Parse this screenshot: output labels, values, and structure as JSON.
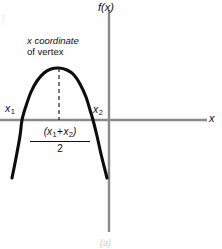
{
  "figure": {
    "panel_caption": "(a)",
    "background_color": "#fefefe"
  },
  "axes": {
    "y_label": "f(x)",
    "x_label": "x",
    "axis_color": "#8a8a8a",
    "x_axis_y": 120,
    "y_axis_x": 109
  },
  "annotations": {
    "vertex_note_line1": "x coordinate",
    "vertex_note_line2": "of vertex",
    "root_label_left": "x",
    "root_label_left_sub": "1",
    "root_label_right": "x",
    "root_label_right_sub": "2",
    "midpoint_numerator_open": "(x",
    "midpoint_numerator_sub1": "1",
    "midpoint_numerator_op": "+",
    "midpoint_numerator_var2": "x",
    "midpoint_numerator_sub2": "2",
    "midpoint_numerator_close": ")",
    "midpoint_denominator": "2"
  },
  "chart_data": {
    "type": "line",
    "title": "",
    "subtitle": "",
    "xlabel": "x",
    "ylabel": "f(x)",
    "curve_name": "downward parabola",
    "curve_color": "#0d0d0d",
    "curve_width": 3.1,
    "grid": false,
    "legend": null,
    "xlim": [
      0,
      207
    ],
    "ylim": [
      249,
      0
    ],
    "roots_px": [
      22,
      93
    ],
    "vertex_px": [
      59,
      68
    ],
    "curve_points_px": [
      [
        12,
        178
      ],
      [
        16,
        158
      ],
      [
        20,
        136
      ],
      [
        22,
        120
      ],
      [
        26,
        106
      ],
      [
        31,
        92
      ],
      [
        37,
        81
      ],
      [
        44,
        73
      ],
      [
        51,
        69
      ],
      [
        59,
        68
      ],
      [
        67,
        70
      ],
      [
        74,
        75
      ],
      [
        80,
        84
      ],
      [
        86,
        97
      ],
      [
        90,
        110
      ],
      [
        93,
        120
      ],
      [
        97,
        136
      ],
      [
        101,
        154
      ],
      [
        105,
        170
      ],
      [
        107,
        178
      ]
    ],
    "guide_line": {
      "name": "vertex-dashed-line",
      "style": "dashed",
      "color": "#2a2a2a",
      "x_px": 59,
      "y_from_px": 68,
      "y_to_px": 120
    },
    "annotation_text": "x coordinate of vertex",
    "midpoint_formula": "(x1 + x2)/2"
  }
}
